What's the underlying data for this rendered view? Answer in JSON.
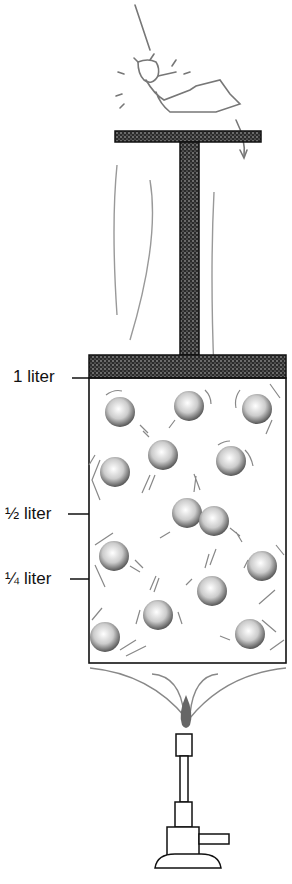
{
  "figure": {
    "labels": {
      "one_liter": "1 liter",
      "half_liter": "½ liter",
      "quarter_liter": "¼ liter"
    },
    "elements": {
      "devil": "devil-figure reclining on piston handle",
      "piston": "stippled T-shaped piston",
      "container": "cylinder containing gas molecules",
      "molecule_count": 14,
      "burner": "bunsen burner with flame"
    },
    "colors": {
      "ink": "#111111",
      "sketch": "#8a8a8a",
      "stipple": "#3a3a3a",
      "background": "#ffffff"
    }
  }
}
